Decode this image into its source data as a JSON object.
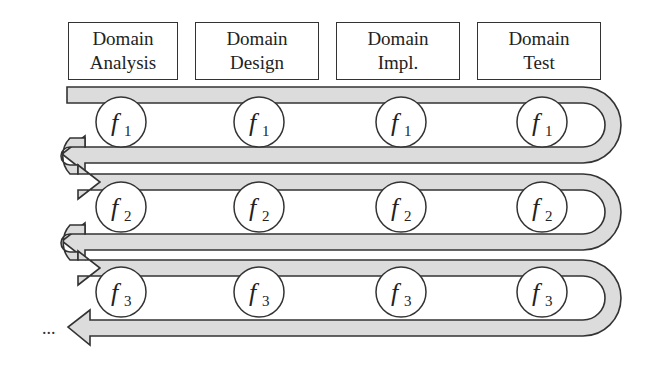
{
  "phases": [
    {
      "line1": "Domain",
      "line2": "Analysis"
    },
    {
      "line1": "Domain",
      "line2": "Design"
    },
    {
      "line1": "Domain",
      "line2": "Impl."
    },
    {
      "line1": "Domain",
      "line2": "Test"
    }
  ],
  "rows": [
    {
      "feature": "f",
      "index": "1"
    },
    {
      "feature": "f",
      "index": "2"
    },
    {
      "feature": "f",
      "index": "3"
    }
  ],
  "continuation": "...",
  "colors": {
    "band_fill": "#dcdcdc",
    "stroke": "#333333",
    "background": "#ffffff"
  }
}
